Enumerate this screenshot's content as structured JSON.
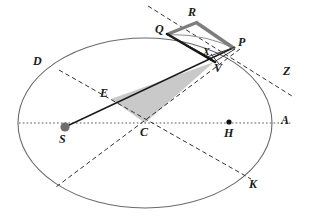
{
  "figure": {
    "background": "#ffffff",
    "stroke_color": "#555555",
    "dark_stroke": "#1a1a1a",
    "shaded_fill": "#c9c9c9",
    "gray_band": "#8a8a8a",
    "width": 311,
    "height": 224
  },
  "ellipse": {
    "name": "orbit-ellipse",
    "cx": 145,
    "cy": 123,
    "rx": 127,
    "ry": 85,
    "stroke": "#666666",
    "fill": "none",
    "stroke_width": 1
  },
  "points": [
    {
      "id": "D",
      "label": "D",
      "x": 60,
      "y": 70,
      "label_x": 33,
      "label_y": 55,
      "marker": "none"
    },
    {
      "id": "Q",
      "label": "Q",
      "x": 167,
      "y": 33,
      "label_x": 155,
      "label_y": 24,
      "marker": "none"
    },
    {
      "id": "R",
      "label": "R",
      "x": 196,
      "y": 20,
      "label_x": 189,
      "label_y": 7,
      "marker": "none"
    },
    {
      "id": "P",
      "label": "P",
      "x": 235,
      "y": 47,
      "label_x": 237,
      "label_y": 37,
      "marker": "none"
    },
    {
      "id": "X",
      "label": "X",
      "x": 208,
      "y": 56,
      "label_x": 204,
      "label_y": 48,
      "marker": "none"
    },
    {
      "id": "V",
      "label": "V",
      "x": 214,
      "y": 61,
      "label_x": 214,
      "label_y": 62,
      "marker": "none"
    },
    {
      "id": "Z",
      "label": "Z",
      "x": 284,
      "y": 78,
      "label_x": 283,
      "label_y": 66,
      "marker": "none"
    },
    {
      "id": "E",
      "label": "E",
      "x": 111,
      "y": 99,
      "label_x": 100,
      "label_y": 88,
      "marker": "none"
    },
    {
      "id": "C",
      "label": "C",
      "x": 145,
      "y": 123,
      "label_x": 141,
      "label_y": 126,
      "marker": "none"
    },
    {
      "id": "S",
      "label": "S",
      "x": 65,
      "y": 127,
      "label_x": 60,
      "label_y": 133,
      "marker": "gray-dot"
    },
    {
      "id": "H",
      "label": "H",
      "x": 229,
      "y": 122,
      "label_x": 224,
      "label_y": 127,
      "marker": "black-dot"
    },
    {
      "id": "A",
      "label": "A",
      "x": 272,
      "y": 123,
      "label_x": 281,
      "label_y": 115,
      "marker": "none"
    },
    {
      "id": "K",
      "label": "K",
      "x": 249,
      "y": 177,
      "label_x": 249,
      "label_y": 178,
      "marker": "none"
    }
  ],
  "markers": {
    "focus_s": {
      "name": "focus-point-s",
      "cx": 65,
      "cy": 127,
      "r": 4.6,
      "fill": "#6e6e6e"
    },
    "focus_h": {
      "name": "focus-point-h",
      "cx": 229,
      "cy": 122,
      "r": 2.6,
      "fill": "#111111"
    }
  },
  "lines": {
    "major_axis": {
      "name": "major-axis-dotted",
      "x1": 19,
      "y1": 123,
      "x2": 292,
      "y2": 123,
      "style": "dotted"
    },
    "diameter_dk": {
      "name": "conjugate-diameter-dk",
      "x1": 59,
      "y1": 70,
      "x2": 250,
      "y2": 178,
      "style": "dashed"
    },
    "diameter_lower_left": {
      "name": "diameter-pc-extended",
      "x1": 239,
      "y1": 50,
      "x2": 57,
      "y2": 186,
      "style": "dashed"
    },
    "tangent_z": {
      "name": "tangent-line-z",
      "x1": 149,
      "y1": 7,
      "x2": 292,
      "y2": 96,
      "style": "dashed"
    },
    "radius_sp": {
      "name": "radius-vector-s-to-p",
      "x1": 65,
      "y1": 127,
      "x2": 232,
      "y2": 48,
      "style": "solid"
    },
    "chord_qv": {
      "name": "chord-q-to-v",
      "x1": 167,
      "y1": 35,
      "x2": 214,
      "y2": 61,
      "style": "solid-thick"
    },
    "seg_qx": {
      "name": "segment-q-to-x",
      "x1": 167,
      "y1": 35,
      "x2": 210,
      "y2": 58,
      "style": "solid-thin"
    },
    "seg_qr": {
      "name": "segment-q-to-r",
      "x1": 167,
      "y1": 35,
      "x2": 197,
      "y2": 23,
      "style": "solid-gray-band"
    },
    "seg_rp": {
      "name": "segment-r-to-p",
      "x1": 197,
      "y1": 23,
      "x2": 234,
      "y2": 49,
      "style": "solid-gray-band"
    },
    "seg_xp": {
      "name": "segment-x-to-p",
      "x1": 208,
      "y1": 57,
      "x2": 234,
      "y2": 48,
      "style": "solid-thin"
    },
    "seg_vp": {
      "name": "segment-v-to-p",
      "x1": 213,
      "y1": 62,
      "x2": 234,
      "y2": 49,
      "style": "solid-thin"
    },
    "arc_qp": {
      "name": "orbit-arc-q-to-p",
      "style": "curve"
    }
  },
  "shaded_region": {
    "name": "swept-area-triangle",
    "vertices": "111,99 214,62 145,123",
    "fill": "#c9c9c9",
    "stroke": "none"
  }
}
